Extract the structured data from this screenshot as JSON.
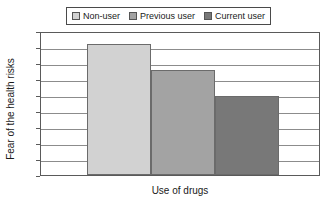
{
  "chart_data": {
    "type": "bar",
    "title": "",
    "categories": [
      "Non-user",
      "Previous user",
      "Current user"
    ],
    "values": [
      8.2,
      6.55,
      4.95
    ],
    "series": [
      {
        "name": "Fear of the health risks",
        "values": [
          8.2,
          6.55,
          4.95
        ]
      }
    ],
    "xlabel": "Use of drugs",
    "ylabel": "Fear of the health risks",
    "ylim": [
      0,
      9
    ],
    "ytick_labels": [
      "0",
      "1",
      "2",
      "3",
      "4",
      "5",
      "6",
      "7",
      "8",
      "9"
    ],
    "ytick_values": [
      0,
      1,
      2,
      3,
      4,
      5,
      6,
      7,
      8,
      9
    ],
    "xtick_labels": [],
    "grid": "horizontal",
    "legend_position": "top-center",
    "colors": {
      "non_user": "#d2d2d2",
      "previous_user": "#a3a3a3",
      "current_user": "#787878",
      "bar_border": "#6b6b6b",
      "gridline": "#8c8c8c",
      "axis": "#5a5a5a",
      "text": "#1a1a1a",
      "background": "#ffffff"
    }
  },
  "legend": {
    "entries": [
      {
        "label": "Non-user",
        "swatch": "#d2d2d2"
      },
      {
        "label": "Previous user",
        "swatch": "#a3a3a3"
      },
      {
        "label": "Current user",
        "swatch": "#787878"
      }
    ]
  },
  "axes": {
    "y_title": "Fear of the health risks",
    "x_title": "Use of drugs",
    "y_ticks": [
      "9",
      "8",
      "7",
      "6",
      "5",
      "4",
      "3",
      "2",
      "1",
      "0"
    ]
  }
}
